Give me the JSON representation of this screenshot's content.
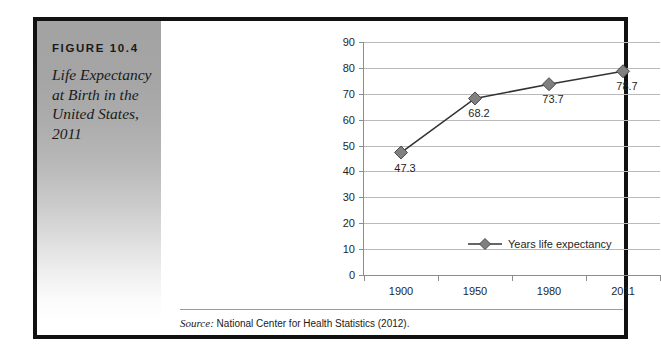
{
  "figure": {
    "number_label": "FIGURE 10.4",
    "title": "Life Expectancy at Birth in the United States, 2011",
    "source_prefix": "Source:",
    "source_text": "National Center for Health Statistics (2012).",
    "frame_color": "#111111",
    "panel_gradient_top": "#a3a3a3",
    "panel_gradient_bottom": "#ffffff"
  },
  "chart_data": {
    "type": "line",
    "title": "Life Expectancy at Birth in the United States, 2011",
    "xlabel": "",
    "ylabel": "",
    "categories": [
      "1900",
      "1950",
      "1980",
      "2011"
    ],
    "values": [
      47.3,
      68.2,
      73.7,
      78.7
    ],
    "point_labels": [
      "47.3",
      "68.2",
      "73.7",
      "78.7"
    ],
    "series": [
      {
        "name": "Years life expectancy",
        "values": [
          47.3,
          68.2,
          73.7,
          78.7
        ],
        "marker": "diamond",
        "marker_color": "#808080",
        "line_color": "#333333"
      }
    ],
    "ylim": [
      0,
      90
    ],
    "ytick_step": 10,
    "yticks": [
      "90",
      "80",
      "70",
      "60",
      "50",
      "40",
      "30",
      "20",
      "10",
      "0"
    ],
    "grid": true,
    "grid_axis": "y",
    "legend": [
      "Years life expectancy"
    ],
    "legend_position": "inside-bottom-center"
  }
}
